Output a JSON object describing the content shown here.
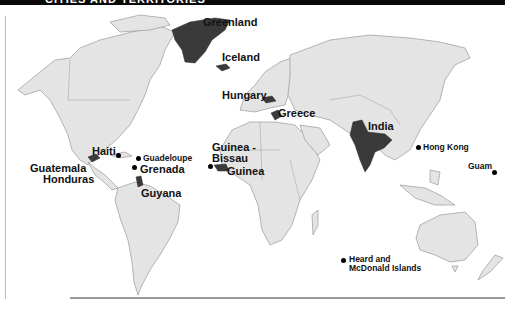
{
  "header": {
    "title": "CITIES AND TERRITORIES"
  },
  "map": {
    "background": "#ffffff",
    "land_color": "#e4e4e4",
    "highlight_color": "#3a3a3a",
    "highlighted_regions": [
      "Greenland",
      "Iceland",
      "Hungary",
      "Greece",
      "India",
      "Haiti",
      "Guatemala",
      "Honduras",
      "Grenada",
      "Guyana",
      "Guinea-Bissau",
      "Guinea"
    ],
    "labels": {
      "greenland": "Greenland",
      "iceland": "Iceland",
      "hungary": "Hungary",
      "greece": "Greece",
      "india": "India",
      "hong_kong": "Hong Kong",
      "guam": "Guam",
      "haiti": "Haiti",
      "guadeloupe": "Guadeloupe",
      "grenada": "Grenada",
      "guatemala": "Guatemala",
      "honduras": "Honduras",
      "guyana": "Guyana",
      "guinea_bissau_1": "Guinea -",
      "guinea_bissau_2": "Bissau",
      "guinea": "Guinea",
      "heard_1": "Heard and",
      "heard_2": "McDonald Islands"
    },
    "point_markers": [
      "Haiti",
      "Guadeloupe",
      "Grenada",
      "Guinea-Bissau",
      "Hong Kong",
      "Guam",
      "Heard and McDonald Islands"
    ]
  }
}
